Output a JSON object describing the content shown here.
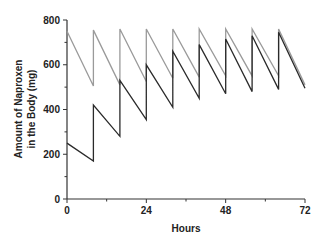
{
  "chart_data": {
    "type": "line",
    "title": "",
    "xlabel": "Hours",
    "ylabel_lines": [
      "Amount of Naproxen",
      "in the Body (mg)"
    ],
    "ylabel": "Amount of Naproxen in the Body (mg)",
    "xlim": [
      0,
      72
    ],
    "ylim": [
      0,
      800
    ],
    "x_ticks": [
      0,
      24,
      48,
      72
    ],
    "x_minor_ticks": [
      12,
      36,
      60
    ],
    "y_ticks": [
      0,
      200,
      400,
      600,
      800
    ],
    "y_minor_ticks": [
      100,
      300,
      500,
      700
    ],
    "grid": false,
    "legend": null,
    "dosing_interval_h": 8,
    "series": [
      {
        "name": "Loading dose regimen (750 mg then 250 mg)",
        "color": "#9a9a9a",
        "points": [
          [
            0,
            750
          ],
          [
            8,
            505
          ],
          [
            8,
            755
          ],
          [
            16,
            510
          ],
          [
            16,
            760
          ],
          [
            24,
            525
          ],
          [
            24,
            760
          ],
          [
            32,
            540
          ],
          [
            32,
            760
          ],
          [
            40,
            545
          ],
          [
            40,
            760
          ],
          [
            48,
            550
          ],
          [
            48,
            760
          ],
          [
            56,
            550
          ],
          [
            56,
            760
          ],
          [
            64,
            550
          ],
          [
            64,
            760
          ],
          [
            72,
            510
          ]
        ]
      },
      {
        "name": "Standard regimen (250 mg every 8 h)",
        "color": "#2a2a2a",
        "points": [
          [
            0,
            250
          ],
          [
            8,
            170
          ],
          [
            8,
            420
          ],
          [
            16,
            280
          ],
          [
            16,
            530
          ],
          [
            24,
            355
          ],
          [
            24,
            600
          ],
          [
            32,
            410
          ],
          [
            32,
            660
          ],
          [
            40,
            450
          ],
          [
            40,
            690
          ],
          [
            48,
            470
          ],
          [
            48,
            715
          ],
          [
            56,
            480
          ],
          [
            56,
            730
          ],
          [
            64,
            490
          ],
          [
            64,
            745
          ],
          [
            72,
            495
          ]
        ]
      }
    ]
  }
}
